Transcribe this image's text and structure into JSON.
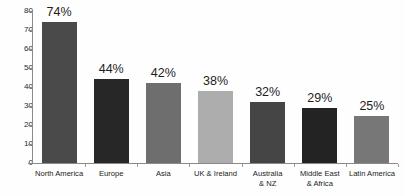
{
  "chart_data": {
    "type": "bar",
    "title": "",
    "subtitle": "",
    "xlabel": "",
    "ylabel": "",
    "ylim": [
      0,
      80
    ],
    "yticks": [
      0,
      10,
      20,
      30,
      40,
      50,
      60,
      70,
      80
    ],
    "ytick_labels": [
      "0",
      "10",
      "20",
      "30",
      "40",
      "50",
      "60",
      "70",
      "80"
    ],
    "grid": false,
    "legend": "none",
    "categories": [
      "North America",
      "Europe",
      "Asia",
      "UK & Ireland",
      "Australia\n& NZ",
      "Middle East\n& Africa",
      "Latin America"
    ],
    "values": [
      74,
      44,
      42,
      38,
      32,
      29,
      25
    ],
    "data_labels": [
      "74%",
      "44%",
      "42%",
      "38%",
      "32%",
      "29%",
      "25%"
    ],
    "bar_colors": [
      "#4a4a4a",
      "#272727",
      "#6e6e6e",
      "#adadad",
      "#454545",
      "#232323",
      "#777777"
    ],
    "background_color": "#fefefe",
    "axis_color": "#8a8a8a",
    "text_color": "#222222"
  }
}
